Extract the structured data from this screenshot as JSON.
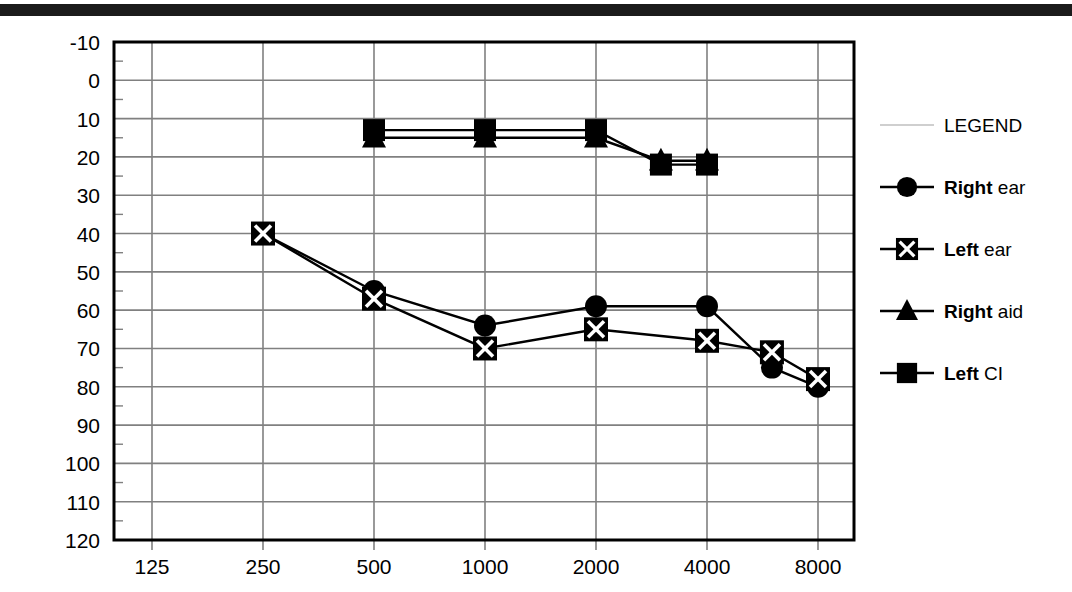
{
  "chart_data": {
    "type": "line",
    "title": "",
    "subtitle": "",
    "xlabel": "",
    "ylabel": "",
    "xscale": "log",
    "x_tick_labels": [
      "125",
      "250",
      "500",
      "1000",
      "2000",
      "4000",
      "8000"
    ],
    "x_tick_values": [
      125,
      250,
      500,
      1000,
      2000,
      4000,
      8000
    ],
    "y_tick_labels": [
      "-10",
      "0",
      "10",
      "20",
      "30",
      "40",
      "50",
      "60",
      "70",
      "80",
      "90",
      "100",
      "110",
      "120"
    ],
    "y_tick_values": [
      -10,
      0,
      10,
      20,
      30,
      40,
      50,
      60,
      70,
      80,
      90,
      100,
      110,
      120
    ],
    "ylim": [
      -10,
      120
    ],
    "y_inverted": true,
    "grid": true,
    "legend_position": "right",
    "series": [
      {
        "name": "Right ear",
        "marker": "filled-circle",
        "x": [
          250,
          500,
          1000,
          2000,
          4000,
          6000,
          8000
        ],
        "values": [
          40,
          55,
          64,
          59,
          59,
          75,
          80
        ]
      },
      {
        "name": "Left ear",
        "marker": "x-in-square",
        "x": [
          250,
          500,
          1000,
          2000,
          4000,
          6000,
          8000
        ],
        "values": [
          40,
          57,
          70,
          65,
          68,
          71,
          78
        ]
      },
      {
        "name": "Right aid",
        "marker": "filled-triangle",
        "x": [
          500,
          1000,
          2000,
          3000,
          4000
        ],
        "values": [
          15,
          15,
          15,
          21,
          21
        ]
      },
      {
        "name": "Left CI",
        "marker": "filled-square",
        "x": [
          500,
          1000,
          2000,
          3000,
          4000
        ],
        "values": [
          13,
          13,
          13,
          22,
          22
        ]
      }
    ]
  },
  "legend": {
    "header": "LEGEND",
    "entries": [
      {
        "bold": "Right",
        "rest": " ear",
        "marker": "filled-circle"
      },
      {
        "bold": "Left",
        "rest": " ear",
        "marker": "x-in-square"
      },
      {
        "bold": "Right",
        "rest": " aid",
        "marker": "filled-triangle"
      },
      {
        "bold": "Left",
        "rest": " CI",
        "marker": "filled-square"
      }
    ]
  },
  "colors": {
    "ink": "#000000",
    "grid": "#808080",
    "frame": "#000000",
    "scan_bar": "#1b1b1b"
  }
}
